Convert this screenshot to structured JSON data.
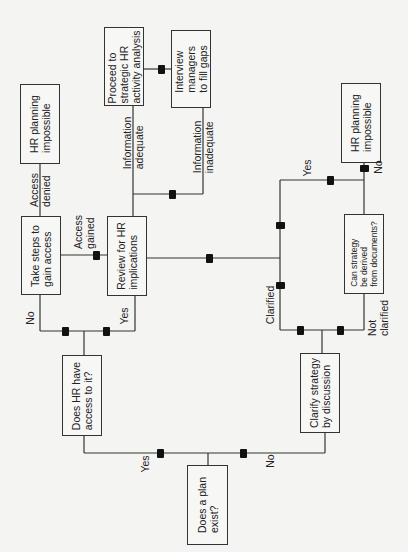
{
  "diagram": {
    "type": "flowchart",
    "orientation": "rotated-90-ccw",
    "colors": {
      "line": "#333333",
      "box_border": "#333333",
      "arrow": "#111111",
      "background": "#f4f4f2"
    },
    "boxes": {
      "hr_impossible_left": "HR planning\nimpossible",
      "take_steps": "Take steps to\ngain access",
      "review": "Review for HR\nimplications",
      "proceed": "Proceed to\nstrategic HR\nactivity analysis",
      "interview": "Interview\nmanagers\nto fill gaps",
      "does_hr_access": "Does HR have\naccess to it?",
      "plan_exist": "Does a plan\nexist?",
      "clarify": "Clarify strategy\nby discussion",
      "can_derive": "Can strategy\nbe derived\nfrom documents?",
      "hr_impossible_right": "HR planning\nimpossible"
    },
    "labels": {
      "access_denied": "Access\ndenied",
      "access_gained": "Access\ngained",
      "info_adequate": "Information\nadequate",
      "info_inadequate": "Information\ninadequate",
      "no_access": "No",
      "yes_access": "Yes",
      "yes_plan": "Yes",
      "no_plan": "No",
      "clarified": "Clarified",
      "not_clarified": "Not\nclarified",
      "yes_derive": "Yes",
      "no_derive": "No"
    }
  }
}
